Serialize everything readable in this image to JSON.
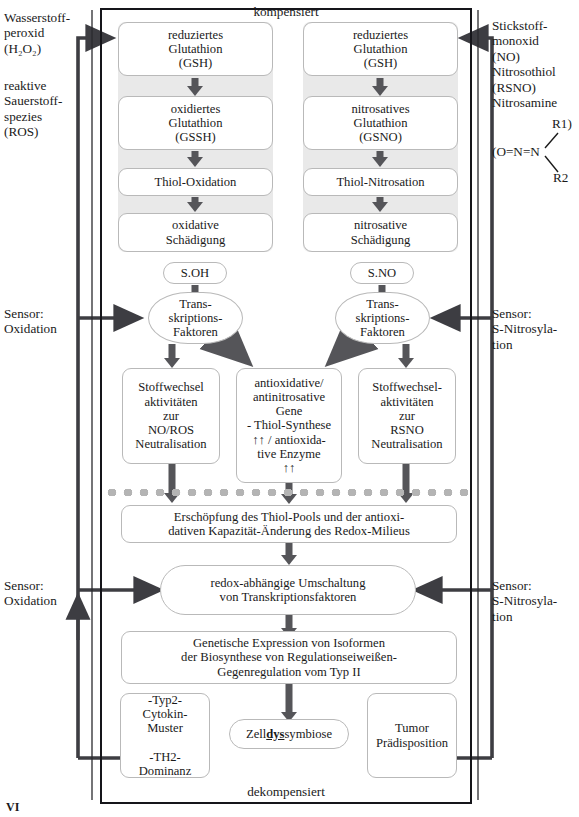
{
  "figure": {
    "corner_label": "VI",
    "frame_top_caption": "kompensiert",
    "frame_bottom_caption": "dekompensiert"
  },
  "side_labels": {
    "top_left": "Wasserstoff-\nperoxid\n(H₂O₂)",
    "top_left_2": "reaktive\nSauerstoff-\nspezies\n(ROS)",
    "top_right": "Stickstoff-\nmonoxid\n(NO)\nNitrosothiol\n(RSNO)\nNitrosamine",
    "chem_formula": "(O=N=N",
    "chem_r1": "R1)",
    "chem_r2": "R2",
    "sensor_left_upper": "Sensor:\nOxidation",
    "sensor_right_upper": "Sensor:\nS-Nitrosyla-\ntion",
    "sensor_left_lower": "Sensor:\nOxidation",
    "sensor_right_lower": "Sensor:\nS-Nitrosyla-\ntion"
  },
  "left_chain": [
    "reduziertes\nGlutathion\n(GSH)",
    "oxidiertes\nGlutathion\n(GSSH)",
    "Thiol-Oxidation",
    "oxidative\nSchädigung"
  ],
  "right_chain": [
    "reduziertes\nGlutathion\n(GSH)",
    "nitrosatives\nGlutathion\n(GSNO)",
    "Thiol-Nitrosation",
    "nitrosative\nSchädigung"
  ],
  "sensor_nodes": {
    "left_tag": "S.OH",
    "right_tag": "S.NO",
    "left_factor": "Trans-\nskriptions-\nFaktoren",
    "right_factor": "Trans-\nskriptions-\nFaktoren"
  },
  "activity_boxes": {
    "left": "Stoffwechsel\naktivitäten\nzur\nNO/ROS\nNeutralisation",
    "middle_line1": "antioxidative/",
    "middle_line2": "antinitrosative",
    "middle_line3": "Gene",
    "middle_line4": "- Thiol-Synthese",
    "middle_line5": "↑↑  / antioxida-",
    "middle_line6": "tive Enzyme",
    "middle_line7": "↑↑",
    "right": "Stoffwechsel-\naktivitäten\nzur\nRSNO\nNeutralisation"
  },
  "lower_boxes": {
    "depletion": "Erschöpfung des Thiol-Pools und der antioxi-\ndativen Kapazität-Änderung des Redox-Milieus",
    "switch": "redox-abhängige Umschaltung\nvon Transkriptionsfaktoren",
    "expression": "Genetische Expression von Isoformen\nder Biosynthese von Regulationseiweißen-\nGegenregulation vom Typ II",
    "cytokin": "-Typ2-\nCytokin-\nMuster\n\n-TH2-\nDominanz",
    "dyssymbiose_pre": "Zell",
    "dyssymbiose_mid": "dys",
    "dyssymbiose_post": "symbiose",
    "tumor": "Tumor\nPrädisposition"
  },
  "colors": {
    "frame": "#15151a",
    "node_border": "#b9b9b9",
    "panel": "#e9e9e9",
    "arrow": "#555559",
    "feedback_line": "#3d3d42",
    "dotted": "#b4b4b4"
  }
}
